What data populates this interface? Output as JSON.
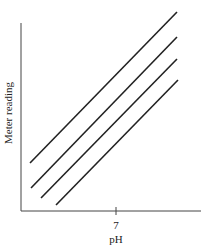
{
  "chart_data": {
    "type": "line",
    "title": "",
    "xlabel": "pH",
    "ylabel": "Meter reading",
    "x_ticks": [
      "7"
    ],
    "grid": false,
    "legend": null,
    "series": [
      {
        "name": "line-1",
        "x_px": [
          30,
          177
        ],
        "y_px": [
          163,
          12
        ]
      },
      {
        "name": "line-2",
        "x_px": [
          31,
          177
        ],
        "y_px": [
          188,
          37
        ]
      },
      {
        "name": "line-3",
        "x_px": [
          41,
          177
        ],
        "y_px": [
          198,
          59
        ]
      },
      {
        "name": "line-4",
        "x_px": [
          56,
          178
        ],
        "y_px": [
          205,
          80
        ]
      }
    ],
    "line_color": "#222222"
  }
}
